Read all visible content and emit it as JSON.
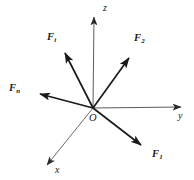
{
  "figure": {
    "type": "vector-force-diagram",
    "background_color": "#ffffff",
    "stroke_color": "#1a1a1a",
    "axis_color": "#4d4d4d",
    "width": 194,
    "height": 180
  },
  "origin": {
    "label": "O",
    "x": 93,
    "y": 108,
    "label_x": 89,
    "label_y": 114
  },
  "axes": [
    {
      "name": "z-axis",
      "label": "z",
      "label_x": 103,
      "label_y": 4,
      "from": {
        "x": 93,
        "y": 108
      },
      "to": {
        "x": 94,
        "y": 13
      },
      "arrow": true
    },
    {
      "name": "y-axis",
      "label": "y",
      "label_x": 178,
      "label_y": 112,
      "from": {
        "x": 93,
        "y": 108
      },
      "to": {
        "x": 186,
        "y": 107
      },
      "arrow": true
    },
    {
      "name": "x-axis",
      "label": "x",
      "label_x": 55,
      "label_y": 166,
      "from": {
        "x": 93,
        "y": 108
      },
      "to": {
        "x": 42,
        "y": 171
      },
      "arrow": true
    }
  ],
  "forces": [
    {
      "name": "force-F1",
      "base": "F",
      "subscript": "1",
      "label_x": 152,
      "label_y": 150,
      "from": {
        "x": 93,
        "y": 108
      },
      "to": {
        "x": 146,
        "y": 149
      },
      "arrow": true
    },
    {
      "name": "force-F2",
      "base": "F",
      "subscript": "2",
      "label_x": 134,
      "label_y": 34,
      "from": {
        "x": 93,
        "y": 108
      },
      "to": {
        "x": 133,
        "y": 52
      },
      "arrow": true
    },
    {
      "name": "force-Fi",
      "base": "F",
      "subscript": "i",
      "label_x": 47,
      "label_y": 33,
      "from": {
        "x": 93,
        "y": 108
      },
      "to": {
        "x": 62,
        "y": 47
      },
      "arrow": true
    },
    {
      "name": "force-Fn",
      "base": "F",
      "subscript": "n",
      "label_x": 9,
      "label_y": 84,
      "from": {
        "x": 93,
        "y": 108
      },
      "to": {
        "x": 31,
        "y": 92
      },
      "arrow": true
    }
  ]
}
